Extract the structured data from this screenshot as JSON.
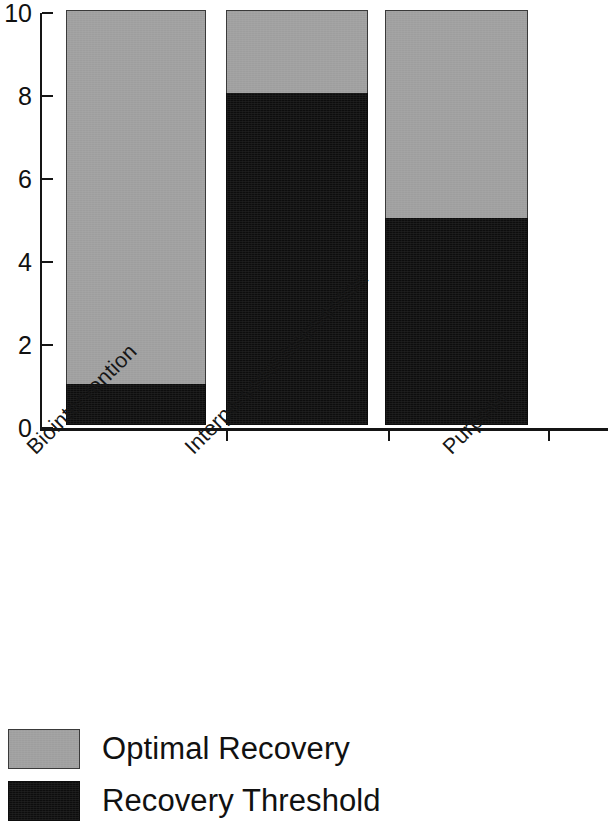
{
  "chart_data": {
    "type": "bar",
    "subtype": "stacked-bar",
    "title": "",
    "xlabel": "",
    "ylabel": "",
    "categories": [
      "Biointervention",
      "Interpersonal Intervention",
      "Purpose"
    ],
    "series": [
      {
        "name": "Recovery Threshold",
        "color": "#0d0d0d",
        "values": [
          1,
          8,
          5
        ]
      },
      {
        "name": "Optimal Recovery",
        "color": "#9e9e9e",
        "values": [
          9,
          2,
          5
        ]
      }
    ],
    "stack_totals": [
      10,
      10,
      10
    ],
    "ylim": [
      0,
      10
    ],
    "yticks": [
      0,
      2,
      4,
      6,
      8,
      10
    ],
    "ytick_labels": [
      "0",
      "2",
      "4",
      "6",
      "8",
      "10"
    ],
    "grid": false,
    "legend_position": "below",
    "legend": [
      {
        "label": "Optimal Recovery",
        "color": "#9e9e9e"
      },
      {
        "label": "Recovery Threshold",
        "color": "#0d0d0d"
      }
    ],
    "xtick_label_rotation": -45
  },
  "axes": {
    "y_tick_labels": [
      "10",
      "8",
      "6",
      "4",
      "2",
      "0"
    ],
    "category_labels": [
      "Biointervention",
      "Interpersonal Intervention",
      "Purpose"
    ]
  },
  "legend": {
    "items": [
      {
        "label": "Optimal Recovery"
      },
      {
        "label": "Recovery Threshold"
      }
    ]
  },
  "colors": {
    "optimal_recovery": "#9e9e9e",
    "recovery_threshold": "#0d0d0d",
    "axis": "#151515",
    "background": "#ffffff"
  }
}
